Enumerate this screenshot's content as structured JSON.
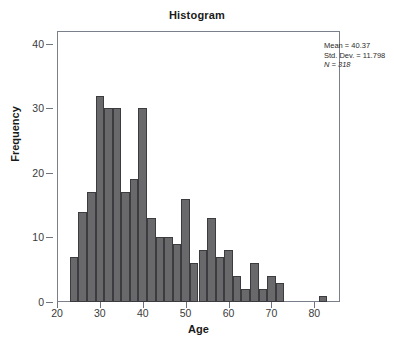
{
  "chart_data": {
    "type": "bar",
    "title": "Histogram",
    "xlabel": "Age",
    "ylabel": "Frequency",
    "xlim": [
      20,
      86
    ],
    "ylim": [
      0,
      42
    ],
    "grid": false,
    "legend": null,
    "bin_width": 2,
    "bar_color": "#69696c",
    "bar_edge_color": "#3c3c40",
    "x_ticks": [
      20,
      30,
      40,
      50,
      60,
      70,
      80
    ],
    "y_ticks": [
      0,
      10,
      20,
      30,
      40
    ],
    "x_tick_labels": [
      "20",
      "30",
      "40",
      "50",
      "60",
      "70",
      "80"
    ],
    "y_tick_labels": [
      "0",
      "10",
      "20",
      "30",
      "40"
    ],
    "bin_starts": [
      23,
      25,
      27,
      29,
      31,
      33,
      35,
      37,
      39,
      41,
      43,
      45,
      47,
      49,
      51,
      53,
      55,
      57,
      59,
      61,
      63,
      65,
      67,
      69,
      71,
      81
    ],
    "values": [
      7,
      14,
      17,
      32,
      30,
      30,
      17,
      19,
      30,
      13,
      10,
      10,
      9,
      16,
      6,
      8,
      13,
      7,
      8,
      4,
      2,
      6,
      2,
      4,
      3,
      1
    ],
    "annotations": {
      "mean_label": "Mean = 40.37",
      "std_dev_label": "Std. Dev. = 11.798",
      "n_label": "N = 318",
      "position": "top-right-outside"
    }
  },
  "stats": {
    "mean": "Mean = 40.37",
    "std_dev": "Std. Dev. = 11.798",
    "n": "N = 318"
  }
}
